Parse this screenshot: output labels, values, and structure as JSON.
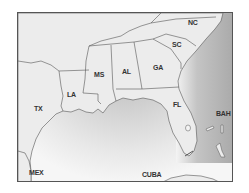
{
  "map": {
    "title": "Southeastern United States and Gulf of Mexico",
    "colors": {
      "land": "#ececec",
      "water_dark": "#b8b8b8",
      "water_light": "#f4f4f4",
      "border": "#555555",
      "label": "#333333"
    },
    "labels": [
      {
        "id": "NC",
        "text": "NC",
        "x": 187,
        "y": 22
      },
      {
        "id": "SC",
        "text": "SC",
        "x": 171,
        "y": 44
      },
      {
        "id": "GA",
        "text": "GA",
        "x": 152,
        "y": 67
      },
      {
        "id": "AL",
        "text": "AL",
        "x": 120,
        "y": 71
      },
      {
        "id": "MS",
        "text": "MS",
        "x": 93,
        "y": 74
      },
      {
        "id": "LA",
        "text": "LA",
        "x": 66,
        "y": 94
      },
      {
        "id": "TX",
        "text": "TX",
        "x": 33,
        "y": 108
      },
      {
        "id": "FL",
        "text": "FL",
        "x": 172,
        "y": 104
      },
      {
        "id": "BAH",
        "text": "BAH",
        "x": 215,
        "y": 113
      },
      {
        "id": "MEX",
        "text": "MEX",
        "x": 28,
        "y": 172
      },
      {
        "id": "CUBA",
        "text": "CUBA",
        "x": 141,
        "y": 174
      }
    ]
  }
}
